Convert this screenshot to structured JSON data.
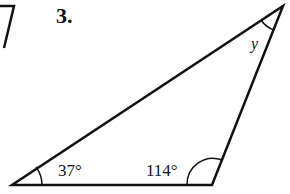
{
  "problem": {
    "number": "3."
  },
  "triangle": {
    "vertices": {
      "bottom_left": [
        12,
        185
      ],
      "bottom_right": [
        212,
        185
      ],
      "top": [
        283,
        6
      ]
    },
    "angles": {
      "bottom_left": "37°",
      "bottom_right": "114°",
      "top": "y"
    }
  },
  "colors": {
    "stroke": "#111111",
    "background": "#ffffff"
  }
}
